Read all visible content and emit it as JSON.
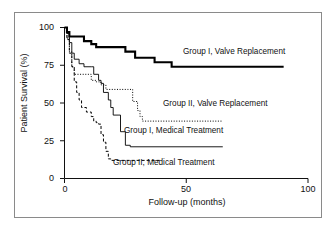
{
  "chart_data": {
    "type": "line",
    "subtype": "kaplan-meier-step",
    "title": "",
    "xlabel": "Follow-up (months)",
    "ylabel": "Patient Survival (%)",
    "xlim": [
      0,
      100
    ],
    "ylim": [
      0,
      100
    ],
    "xticks": [
      0,
      50,
      100
    ],
    "yticks": [
      0,
      25,
      50,
      75,
      100
    ],
    "grid": false,
    "legend_position": "inline-annotations",
    "series": [
      {
        "name": "Group I, Valve Replacement",
        "style": "solid-thick",
        "color": "#000000",
        "steps": [
          [
            0,
            100
          ],
          [
            1,
            97
          ],
          [
            2,
            94
          ],
          [
            5,
            94
          ],
          [
            8,
            91
          ],
          [
            11,
            89
          ],
          [
            13,
            87
          ],
          [
            23,
            87
          ],
          [
            25,
            84
          ],
          [
            27,
            84
          ],
          [
            29,
            80
          ],
          [
            33,
            80
          ],
          [
            37,
            77
          ],
          [
            44,
            74
          ],
          [
            90,
            74
          ]
        ]
      },
      {
        "name": "Group II, Valve Replacement",
        "style": "dotted",
        "color": "#000000",
        "steps": [
          [
            0,
            100
          ],
          [
            1,
            93
          ],
          [
            2,
            84
          ],
          [
            3,
            74
          ],
          [
            4,
            69
          ],
          [
            9,
            69
          ],
          [
            11,
            65
          ],
          [
            13,
            64
          ],
          [
            15,
            62
          ],
          [
            17,
            59
          ],
          [
            21,
            59
          ],
          [
            26,
            59
          ],
          [
            28,
            51
          ],
          [
            30,
            45
          ],
          [
            31,
            41
          ],
          [
            32,
            38
          ],
          [
            65,
            38
          ]
        ]
      },
      {
        "name": "Group I, Medical Treatment",
        "style": "solid-thin",
        "color": "#000000",
        "steps": [
          [
            0,
            100
          ],
          [
            1,
            96
          ],
          [
            2,
            90
          ],
          [
            3,
            83
          ],
          [
            4,
            79
          ],
          [
            6,
            76
          ],
          [
            8,
            74
          ],
          [
            11,
            74
          ],
          [
            12,
            69
          ],
          [
            14,
            65
          ],
          [
            15,
            63
          ],
          [
            16,
            57
          ],
          [
            18,
            52
          ],
          [
            19,
            47
          ],
          [
            20,
            42
          ],
          [
            22,
            42
          ],
          [
            23,
            31
          ],
          [
            25,
            22
          ],
          [
            27,
            21
          ],
          [
            65,
            21
          ]
        ]
      },
      {
        "name": "Group II, Medical Treatment",
        "style": "dashed",
        "color": "#000000",
        "steps": [
          [
            0,
            100
          ],
          [
            1,
            92
          ],
          [
            2,
            83
          ],
          [
            3,
            74
          ],
          [
            4,
            64
          ],
          [
            5,
            57
          ],
          [
            6,
            52
          ],
          [
            7,
            47
          ],
          [
            9,
            44
          ],
          [
            11,
            41
          ],
          [
            12,
            38
          ],
          [
            13,
            37
          ],
          [
            14,
            36
          ],
          [
            15,
            29
          ],
          [
            16,
            24
          ],
          [
            17,
            18
          ],
          [
            18,
            13
          ],
          [
            19,
            12
          ],
          [
            40,
            12
          ]
        ]
      }
    ],
    "annotations": [
      {
        "text": "Group I, Valve Replacement",
        "x_px": 183,
        "y_px": 52
      },
      {
        "text": "Group II, Valve Replacement",
        "x_px": 163,
        "y_px": 104
      },
      {
        "text": "Group I, Medical Treatment",
        "x_px": 124,
        "y_px": 131
      },
      {
        "text": "Group II, Medical Treatment",
        "x_px": 113,
        "y_px": 163
      }
    ]
  },
  "axes": {
    "y_title": "Patient Survival (%)",
    "x_title": "Follow-up (months)",
    "y_ticks": [
      "100",
      "75",
      "50",
      "25",
      "0"
    ],
    "x_ticks": [
      "0",
      "50",
      "100"
    ]
  },
  "colors": {
    "ink": "#000000",
    "frame": "#8a8a8a",
    "background": "#ffffff"
  }
}
